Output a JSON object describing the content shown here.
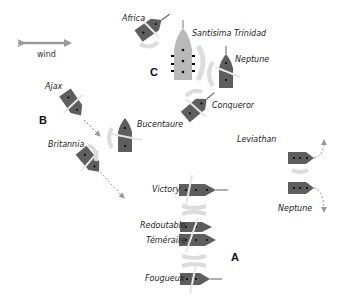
{
  "diagram": {
    "type": "naval-battle-plan",
    "wind": {
      "label": "wind",
      "direction": "east"
    },
    "colors": {
      "british_ship": "#5e5e5e",
      "franco_spanish_flagship": "#b9b9b9",
      "smoke": "#dcdcdc",
      "arrow": "#9a9a9a",
      "text": "#222222"
    },
    "groups": [
      {
        "label": "A"
      },
      {
        "label": "B"
      },
      {
        "label": "C"
      }
    ],
    "ships": [
      {
        "name": "Africa"
      },
      {
        "name": "Santisima Trinidad"
      },
      {
        "name": "Neptune",
        "id": "neptune-top"
      },
      {
        "name": "Conqueror"
      },
      {
        "name": "Ajax"
      },
      {
        "name": "Bucentaure"
      },
      {
        "name": "Britannia"
      },
      {
        "name": "Leviathan"
      },
      {
        "name": "Neptune",
        "id": "neptune-right"
      },
      {
        "name": "Victory"
      },
      {
        "name": "Redoutable"
      },
      {
        "name": "Téméraire"
      },
      {
        "name": "Fougueux"
      }
    ]
  }
}
